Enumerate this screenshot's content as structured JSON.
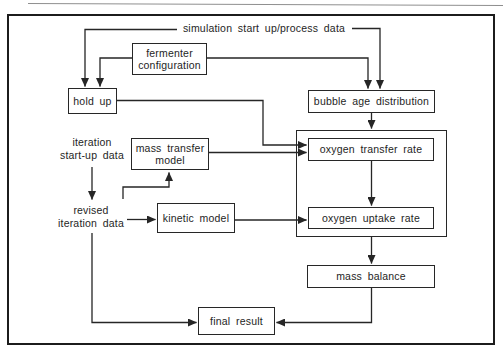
{
  "diagram_type": "flowchart",
  "colors": {
    "line": "#262626",
    "text": "#1e1e1e",
    "background": "#ffffff"
  },
  "labels": {
    "simulation_data": "simulation start up/process data",
    "iteration_startup": "iteration\nstart-up data",
    "revised_iteration": "revised\niteration data"
  },
  "nodes": {
    "fermenter_configuration": "fermenter\nconfiguration",
    "hold_up": "hold up",
    "bubble_age_distribution": "bubble age distribution",
    "mass_transfer_model": "mass transfer\nmodel",
    "kinetic_model": "kinetic model",
    "oxygen_transfer_rate": "oxygen transfer rate",
    "oxygen_uptake_rate": "oxygen uptake rate",
    "mass_balance": "mass balance",
    "final_result": "final result"
  },
  "edges": [
    {
      "from": "simulation start up/process data",
      "to": "hold up"
    },
    {
      "from": "simulation start up/process data",
      "to": "bubble age distribution"
    },
    {
      "from": "fermenter configuration",
      "to": "hold up"
    },
    {
      "from": "fermenter configuration",
      "to": "bubble age distribution"
    },
    {
      "from": "bubble age distribution",
      "to": "oxygen transfer rate"
    },
    {
      "from": "hold up",
      "to": "oxygen transfer rate"
    },
    {
      "from": "mass transfer model",
      "to": "oxygen transfer rate"
    },
    {
      "from": "oxygen transfer rate",
      "to": "oxygen uptake rate"
    },
    {
      "from": "iteration start-up data",
      "to": "revised iteration data"
    },
    {
      "from": "revised iteration data",
      "to": "kinetic model"
    },
    {
      "from": "revised iteration data",
      "to": "mass transfer model"
    },
    {
      "from": "kinetic model",
      "to": "oxygen uptake rate"
    },
    {
      "from": "oxygen uptake rate",
      "to": "mass balance"
    },
    {
      "from": "mass balance",
      "to": "final result"
    },
    {
      "from": "revised iteration data",
      "to": "final result"
    }
  ]
}
